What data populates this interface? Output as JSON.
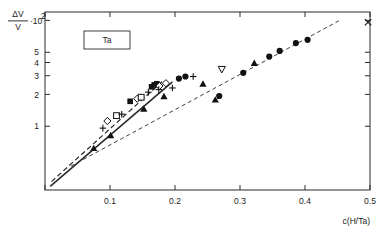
{
  "chart_data": {
    "type": "scatter",
    "title": "",
    "xlabel": "c(H/Ta)",
    "ylabel_numerator": "ΔV",
    "ylabel_denominator": "V",
    "ylabel_factor": "·10",
    "ylabel_exponent": "2",
    "ylabel": "ΔV/V · 10²",
    "annotation": "Ta",
    "xscale": "linear",
    "yscale": "log",
    "xlim": [
      0.0,
      0.5
    ],
    "ylim": [
      0.25,
      12.0
    ],
    "grid": false,
    "legend_position": "none",
    "xticks": [
      0.0,
      0.1,
      0.2,
      0.3,
      0.4,
      0.5
    ],
    "xticklabels": [
      "",
      "0.1",
      "0.2",
      "0.3",
      "0.4",
      "0.5"
    ],
    "yticks": [
      1,
      2,
      3,
      4,
      5,
      10
    ],
    "yticklabels": [
      "1",
      "2",
      "3",
      "4",
      "5",
      "10²"
    ],
    "yminor": [
      0.3,
      0.4,
      0.5,
      0.6,
      0.7,
      0.8,
      0.9,
      6,
      7,
      8,
      9
    ],
    "series": [
      {
        "name": "filled-circle",
        "marker": "circle-filled",
        "points": [
          [
            0.268,
            1.93
          ],
          [
            0.305,
            3.2
          ],
          [
            0.345,
            4.55
          ],
          [
            0.361,
            5.15
          ],
          [
            0.386,
            6.1
          ],
          [
            0.404,
            6.55
          ],
          [
            0.206,
            2.82
          ],
          [
            0.216,
            2.95
          ]
        ]
      },
      {
        "name": "filled-triangle",
        "marker": "triangle-filled",
        "points": [
          [
            0.075,
            0.62
          ],
          [
            0.152,
            1.46
          ],
          [
            0.183,
            1.92
          ],
          [
            0.243,
            2.52
          ],
          [
            0.322,
            3.95
          ],
          [
            0.262,
            1.78
          ],
          [
            0.101,
            0.82
          ]
        ]
      },
      {
        "name": "open-inverted-triangle",
        "marker": "triangle-down-open",
        "points": [
          [
            0.272,
            3.45
          ]
        ]
      },
      {
        "name": "filled-square",
        "marker": "square-filled",
        "points": [
          [
            0.131,
            1.72
          ],
          [
            0.164,
            2.36
          ],
          [
            0.168,
            2.46
          ],
          [
            0.172,
            2.52
          ]
        ]
      },
      {
        "name": "open-diamond",
        "marker": "diamond-open",
        "points": [
          [
            0.096,
            1.12
          ],
          [
            0.142,
            1.82
          ],
          [
            0.176,
            2.4
          ],
          [
            0.186,
            2.55
          ]
        ]
      },
      {
        "name": "open-square",
        "marker": "square-open",
        "points": [
          [
            0.11,
            1.26
          ],
          [
            0.148,
            1.88
          ]
        ]
      },
      {
        "name": "plus",
        "marker": "plus",
        "points": [
          [
            0.089,
            0.96
          ],
          [
            0.118,
            1.3
          ],
          [
            0.159,
            2.1
          ],
          [
            0.196,
            2.3
          ],
          [
            0.228,
            2.95
          ],
          [
            0.175,
            2.22
          ]
        ]
      },
      {
        "name": "cross",
        "marker": "x",
        "points": [
          [
            0.497,
            9.6
          ]
        ]
      }
    ],
    "fit_lines": [
      {
        "name": "solid-lower-trend",
        "style": "solid",
        "from": [
          0.008,
          0.27
        ],
        "to": [
          0.196,
          2.62
        ]
      },
      {
        "name": "dashed-steep-trend",
        "style": "dashed",
        "from": [
          0.01,
          0.3
        ],
        "to": [
          0.182,
          2.7
        ]
      },
      {
        "name": "dashed-long-extrapolation",
        "style": "dashed",
        "from": [
          0.04,
          0.42
        ],
        "to": [
          0.452,
          9.9
        ]
      }
    ]
  }
}
